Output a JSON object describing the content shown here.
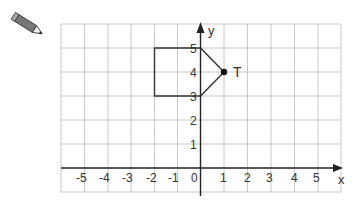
{
  "diagram": {
    "type": "coordinate-grid",
    "point_label": "T",
    "axis_labels": {
      "x": "x",
      "y": "y"
    },
    "origin_label": "0",
    "x_ticks": [
      "-5",
      "-4",
      "-3",
      "-2",
      "-1",
      "1",
      "2",
      "3",
      "4",
      "5"
    ],
    "y_ticks": [
      "1",
      "2",
      "3",
      "4",
      "5"
    ],
    "shape_vertices": [
      [
        -2,
        5
      ],
      [
        0,
        5
      ],
      [
        1,
        4
      ],
      [
        0,
        3
      ],
      [
        -2,
        3
      ]
    ],
    "point_T": [
      1,
      4
    ],
    "colors": {
      "grid": "#c8c8c8",
      "axis": "#222222",
      "shape": "#333333"
    }
  },
  "icon": "pencil-icon"
}
